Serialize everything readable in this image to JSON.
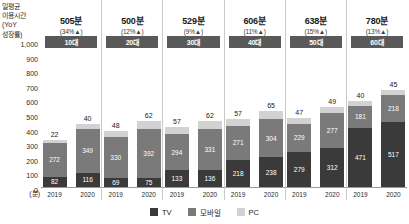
{
  "axis": {
    "title": "일평균\n이용시간\n(YoY\n성장률)",
    "title_line1": "일평균",
    "title_line2": "이용시간",
    "title_line3": "(YoY",
    "title_line4": "성장률)",
    "unit": "(분)",
    "ticks": [
      "1,000",
      "900",
      "800",
      "700",
      "600",
      "500",
      "400",
      "300",
      "200",
      "100",
      "0"
    ],
    "max": 1000,
    "min": 0
  },
  "legend": [
    {
      "label": "TV",
      "color": "#3a3a3a",
      "key": "tv"
    },
    {
      "label": "모바일",
      "color": "#7a7a7a",
      "key": "mobile"
    },
    {
      "label": "PC",
      "color": "#d2d2d2",
      "key": "pc"
    }
  ],
  "groups": [
    {
      "age": "10대",
      "kpi_total": "505분",
      "kpi_growth": "(34%▲)",
      "years": [
        {
          "year": "2019",
          "tv": 82,
          "mobile": 272,
          "pc": 22,
          "total": 376
        },
        {
          "year": "2020",
          "tv": 116,
          "mobile": 349,
          "pc": 40,
          "total": 505
        }
      ]
    },
    {
      "age": "20대",
      "kpi_total": "500분",
      "kpi_growth": "(12%▲)",
      "years": [
        {
          "year": "2019",
          "tv": 69,
          "mobile": 330,
          "pc": 48,
          "total": 447
        },
        {
          "year": "2020",
          "tv": 75,
          "mobile": 392,
          "pc": 62,
          "total": 529
        }
      ]
    },
    {
      "age": "30대",
      "kpi_total": "529분",
      "kpi_growth": "(9%▲)",
      "years": [
        {
          "year": "2019",
          "tv": 133,
          "mobile": 294,
          "pc": 57,
          "total": 484
        },
        {
          "year": "2020",
          "tv": 136,
          "mobile": 331,
          "pc": 62,
          "total": 529
        }
      ]
    },
    {
      "age": "40대",
      "kpi_total": "606분",
      "kpi_growth": "(11%▲)",
      "years": [
        {
          "year": "2019",
          "tv": 218,
          "mobile": 271,
          "pc": 57,
          "total": 546
        },
        {
          "year": "2020",
          "tv": 238,
          "mobile": 304,
          "pc": 65,
          "total": 607
        }
      ]
    },
    {
      "age": "50대",
      "kpi_total": "638분",
      "kpi_growth": "(15%▲)",
      "years": [
        {
          "year": "2019",
          "tv": 279,
          "mobile": 229,
          "pc": 47,
          "total": 555
        },
        {
          "year": "2020",
          "tv": 312,
          "mobile": 277,
          "pc": 49,
          "total": 638
        }
      ]
    },
    {
      "age": "60대",
      "kpi_total": "780분",
      "kpi_growth": "(13%▲)",
      "years": [
        {
          "year": "2019",
          "tv": 471,
          "mobile": 181,
          "pc": 40,
          "total": 692
        },
        {
          "year": "2020",
          "tv": 517,
          "mobile": 218,
          "pc": 45,
          "total": 780
        }
      ]
    }
  ],
  "chart_data": {
    "type": "bar",
    "title": "일평균 이용시간 (YoY 성장률)",
    "subtitle": "",
    "xlabel": "",
    "ylabel": "(분)",
    "ylim": [
      0,
      1000
    ],
    "grid": false,
    "stacked": true,
    "legend_position": "bottom",
    "categories": [
      "10대 2019",
      "10대 2020",
      "20대 2019",
      "20대 2020",
      "30대 2019",
      "30대 2020",
      "40대 2019",
      "40대 2020",
      "50대 2019",
      "50대 2020",
      "60대 2019",
      "60대 2020"
    ],
    "series": [
      {
        "name": "TV",
        "values": [
          82,
          116,
          69,
          75,
          133,
          136,
          218,
          238,
          279,
          312,
          471,
          517
        ]
      },
      {
        "name": "모바일",
        "values": [
          272,
          349,
          330,
          392,
          294,
          331,
          271,
          304,
          229,
          277,
          181,
          218
        ]
      },
      {
        "name": "PC",
        "values": [
          22,
          40,
          48,
          62,
          57,
          62,
          57,
          65,
          47,
          49,
          40,
          45
        ]
      }
    ],
    "annotations": [
      {
        "group": "10대",
        "total_2020": "505분",
        "yoy": "34%▲"
      },
      {
        "group": "20대",
        "total_2020": "500분",
        "yoy": "12%▲"
      },
      {
        "group": "30대",
        "total_2020": "529분",
        "yoy": "9%▲"
      },
      {
        "group": "40대",
        "total_2020": "606분",
        "yoy": "11%▲"
      },
      {
        "group": "50대",
        "total_2020": "638분",
        "yoy": "15%▲"
      },
      {
        "group": "60대",
        "total_2020": "780분",
        "yoy": "13%▲"
      }
    ],
    "tick_labels": [
      "1,000",
      "900",
      "800",
      "700",
      "600",
      "500",
      "400",
      "300",
      "200",
      "100",
      "0"
    ]
  }
}
